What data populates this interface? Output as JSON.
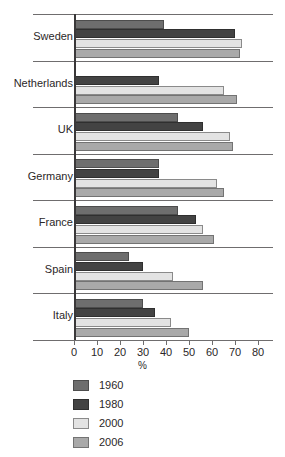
{
  "chart_data": {
    "type": "bar",
    "orientation": "horizontal",
    "title": "",
    "xlabel": "%",
    "ylabel": "",
    "xlim": [
      0,
      80
    ],
    "xticks": [
      0,
      10,
      20,
      30,
      40,
      50,
      60,
      70,
      80
    ],
    "xtick_labels": [
      "0",
      "10",
      "20",
      "30",
      "40",
      "50",
      "60",
      "70",
      "80"
    ],
    "grid": false,
    "legend_position": "below",
    "categories": [
      "Sweden",
      "Netherlands",
      "UK",
      "Germany",
      "France",
      "Spain",
      "Italy"
    ],
    "series": [
      {
        "name": "1960",
        "color": "#6e6e6e",
        "values": [
          39,
          null,
          45,
          37,
          45,
          24,
          30
        ]
      },
      {
        "name": "1980",
        "color": "#434343",
        "values": [
          70,
          37,
          56,
          37,
          53,
          30,
          35
        ]
      },
      {
        "name": "2000",
        "color": "#e3e3e3",
        "values": [
          73,
          65,
          68,
          62,
          56,
          43,
          42
        ]
      },
      {
        "name": "2006",
        "color": "#a9a9a9",
        "values": [
          72,
          71,
          69,
          65,
          61,
          56,
          50
        ]
      }
    ]
  },
  "axis": {
    "x_title": "%"
  },
  "legend": {
    "entries": [
      {
        "label": "1960",
        "key": "s1960"
      },
      {
        "label": "1980",
        "key": "s1980"
      },
      {
        "label": "2000",
        "key": "s2000"
      },
      {
        "label": "2006",
        "key": "s2006"
      }
    ]
  },
  "fragments": {
    "top_cropped_text": "",
    "bottom_cropped_caption": ""
  }
}
